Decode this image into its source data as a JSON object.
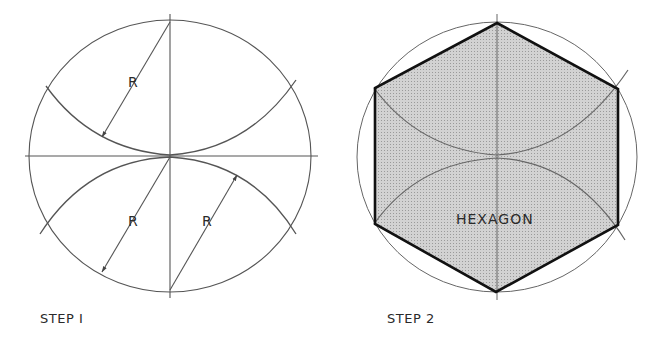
{
  "figure": {
    "step1": {
      "caption": "STEP I",
      "radius_labels": [
        "R",
        "R",
        "R"
      ]
    },
    "step2": {
      "caption": "STEP 2",
      "shape_label": "HEXAGON"
    }
  },
  "colors": {
    "line": "#555555",
    "hexagon_outline": "#111111",
    "hexagon_fill": "#c9c9c9",
    "background": "#ffffff"
  }
}
